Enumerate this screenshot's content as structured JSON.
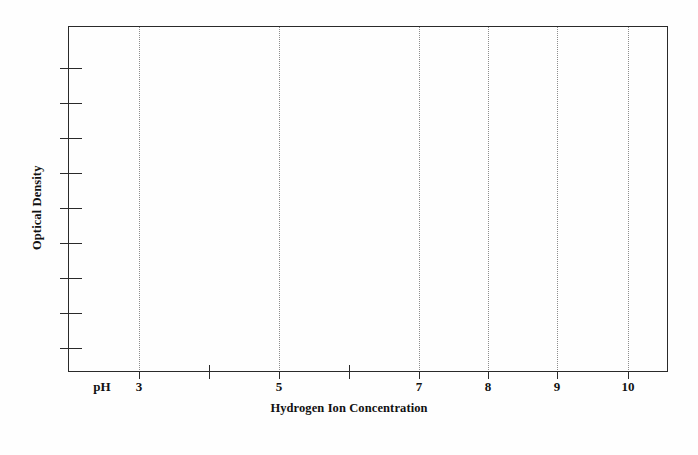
{
  "chart_data": {
    "type": "line",
    "title": "",
    "subtitle": "",
    "xlabel": "Hydrogen Ion Concentration",
    "ylabel": "Optical Density",
    "x_prefix_label": "pH",
    "xlim": [
      2.0,
      10.6
    ],
    "ylim": [
      0,
      1
    ],
    "grid": true,
    "grid_axis": "x",
    "grid_style": "dotted",
    "legend": null,
    "series": [],
    "values": [],
    "categories": [],
    "note": "Empty axis frame: no data series are plotted inside the panel.",
    "x_ticks": [
      {
        "value": 3,
        "label": "3",
        "px": 139,
        "gridline": true,
        "labeled": true
      },
      {
        "value": 4,
        "label": "",
        "px": 209,
        "gridline": false,
        "labeled": false
      },
      {
        "value": 5,
        "label": "5",
        "px": 279,
        "gridline": true,
        "labeled": true
      },
      {
        "value": 6,
        "label": "",
        "px": 349,
        "gridline": false,
        "labeled": false
      },
      {
        "value": 7,
        "label": "7",
        "px": 419,
        "gridline": true,
        "labeled": true
      },
      {
        "value": 8,
        "label": "8",
        "px": 488,
        "gridline": true,
        "labeled": true
      },
      {
        "value": 9,
        "label": "9",
        "px": 557,
        "gridline": true,
        "labeled": true
      },
      {
        "value": 10,
        "label": "10",
        "px": 628,
        "gridline": true,
        "labeled": true
      }
    ],
    "y_ticks": [
      {
        "label": "",
        "px": 68
      },
      {
        "label": "",
        "px": 103
      },
      {
        "label": "",
        "px": 138
      },
      {
        "label": "",
        "px": 173
      },
      {
        "label": "",
        "px": 208
      },
      {
        "label": "",
        "px": 243
      },
      {
        "label": "",
        "px": 278
      },
      {
        "label": "",
        "px": 313
      },
      {
        "label": "",
        "px": 348
      }
    ],
    "colors": {
      "axis": "#2a2a2a",
      "gridline": "#8d8d8d",
      "text": "#111111",
      "background": "#fefefe"
    }
  }
}
